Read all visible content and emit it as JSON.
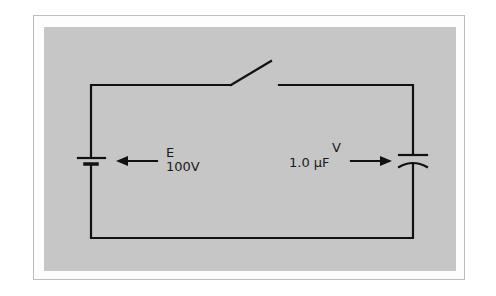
{
  "diagram": {
    "type": "circuit",
    "components": {
      "battery": {
        "label": "E",
        "value": "100V"
      },
      "capacitor": {
        "label": "V",
        "value": "1.0 μF"
      },
      "switch": {
        "state": "open"
      }
    },
    "colors": {
      "panel": "#c6c6c6",
      "wire": "#111111",
      "frame_border": "#bdbdbd"
    }
  }
}
